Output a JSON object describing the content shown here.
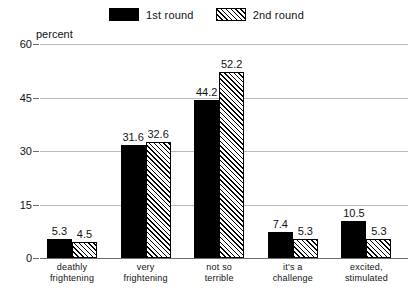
{
  "chart_data": {
    "type": "bar",
    "title": "",
    "xlabel": "",
    "ylabel": "percent",
    "ylim": [
      0,
      60
    ],
    "yticks": [
      "0",
      "15",
      "30",
      "45",
      "60"
    ],
    "grid": true,
    "legend_position": "top-center",
    "categories": [
      "deathly\nfrightening",
      "very\nfrightening",
      "not so\nterrible",
      "it's a\nchallenge",
      "excited,\nstimulated"
    ],
    "series": [
      {
        "name": "1st round",
        "fill": "solid-black",
        "color": "#000000",
        "values": [
          5.3,
          31.6,
          44.2,
          7.4,
          10.5
        ],
        "labels": [
          "5.3",
          "31.6",
          "44.2",
          "7.4",
          "10.5"
        ]
      },
      {
        "name": "2nd round",
        "fill": "diagonal-hatch",
        "color": "#000000",
        "values": [
          4.5,
          32.6,
          52.2,
          5.3,
          5.3
        ],
        "labels": [
          "4.5",
          "32.6",
          "52.2",
          "5.3",
          "5.3"
        ]
      }
    ]
  },
  "legend": {
    "items": [
      {
        "label": "1st round",
        "swatch": "solid-swatch"
      },
      {
        "label": "2nd round",
        "swatch": "hatched-swatch"
      }
    ]
  },
  "axis": {
    "unit_label": "percent",
    "y_tick_0": "0",
    "y_tick_1": "15",
    "y_tick_2": "30",
    "y_tick_3": "45",
    "y_tick_4": "60"
  },
  "colors": {
    "series_1": "#000000",
    "series_2": "#000000",
    "gridline": "#b9b9b9",
    "axis": "#6d6d6d",
    "background": "#ffffff"
  }
}
